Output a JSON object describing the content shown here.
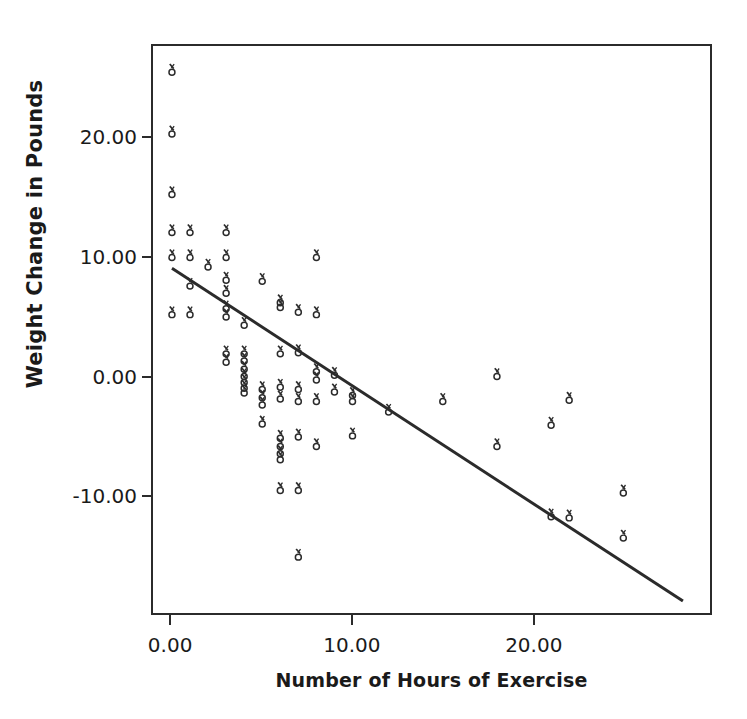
{
  "chart_data": {
    "type": "scatter",
    "title": "",
    "xlabel": "Number of Hours of Exercise",
    "ylabel": "Weight Change in Pounds",
    "xlim": [
      -1.05,
      29.8
    ],
    "ylim": [
      -19.9,
      27.8
    ],
    "grid": false,
    "legend": null,
    "x_ticks": [
      {
        "value": 0,
        "label": "0.00"
      },
      {
        "value": 10,
        "label": "10.00"
      },
      {
        "value": 20,
        "label": "20.00"
      }
    ],
    "y_ticks": [
      {
        "value": 20,
        "label": "20.00"
      },
      {
        "value": 10,
        "label": "10.00"
      },
      {
        "value": 0,
        "label": "0.00"
      },
      {
        "value": -10,
        "label": "-10.00"
      }
    ],
    "marker": {
      "shape": "open-circle-with-tick",
      "color": "#2b2b2b",
      "size": 5
    },
    "series": [
      {
        "name": "Participants",
        "points": [
          [
            0,
            25.6
          ],
          [
            0,
            20.4
          ],
          [
            0,
            15.3
          ],
          [
            0,
            12.1
          ],
          [
            0,
            10.0
          ],
          [
            0,
            5.2
          ],
          [
            1,
            12.1
          ],
          [
            1,
            10.0
          ],
          [
            1,
            7.6
          ],
          [
            1,
            5.2
          ],
          [
            2,
            9.2
          ],
          [
            3,
            12.1
          ],
          [
            3,
            10.0
          ],
          [
            3,
            8.1
          ],
          [
            3,
            7.0
          ],
          [
            3,
            5.7
          ],
          [
            3,
            5.0
          ],
          [
            3,
            1.9
          ],
          [
            3,
            1.2
          ],
          [
            4,
            4.3
          ],
          [
            4,
            1.9
          ],
          [
            4,
            1.3
          ],
          [
            4,
            0.6
          ],
          [
            4,
            0.0
          ],
          [
            4,
            -0.5
          ],
          [
            4,
            -1.0
          ],
          [
            4,
            -1.4
          ],
          [
            5,
            8.0
          ],
          [
            5,
            -1.1
          ],
          [
            5,
            -1.8
          ],
          [
            5,
            -2.4
          ],
          [
            5,
            -4.0
          ],
          [
            6,
            6.2
          ],
          [
            6,
            5.8
          ],
          [
            6,
            1.9
          ],
          [
            6,
            -0.9
          ],
          [
            6,
            -1.9
          ],
          [
            6,
            -5.2
          ],
          [
            6,
            -5.9
          ],
          [
            6,
            -6.5
          ],
          [
            6,
            -7.0
          ],
          [
            6,
            -9.6
          ],
          [
            7,
            5.4
          ],
          [
            7,
            2.0
          ],
          [
            7,
            -1.1
          ],
          [
            7,
            -2.1
          ],
          [
            7,
            -5.1
          ],
          [
            7,
            -9.6
          ],
          [
            7,
            -15.2
          ],
          [
            8,
            10.0
          ],
          [
            8,
            5.2
          ],
          [
            8,
            0.4
          ],
          [
            8,
            -0.3
          ],
          [
            8,
            -2.1
          ],
          [
            8,
            -5.9
          ],
          [
            9,
            0.1
          ],
          [
            9,
            -1.3
          ],
          [
            10,
            -1.6
          ],
          [
            10,
            -2.1
          ],
          [
            10,
            -5.0
          ],
          [
            12,
            -3.0
          ],
          [
            15,
            -2.1
          ],
          [
            18,
            0.0
          ],
          [
            18,
            -5.9
          ],
          [
            21,
            -4.1
          ],
          [
            21,
            -11.8
          ],
          [
            22,
            -2.0
          ],
          [
            22,
            -11.9
          ],
          [
            25,
            -9.8
          ],
          [
            25,
            -13.6
          ]
        ]
      }
    ],
    "fit_line": {
      "type": "linear-regression",
      "color": "#2b2b2b",
      "width": 3,
      "x_start": 0.0,
      "y_start": 9.1,
      "x_end": 28.3,
      "y_end": -18.9
    }
  }
}
